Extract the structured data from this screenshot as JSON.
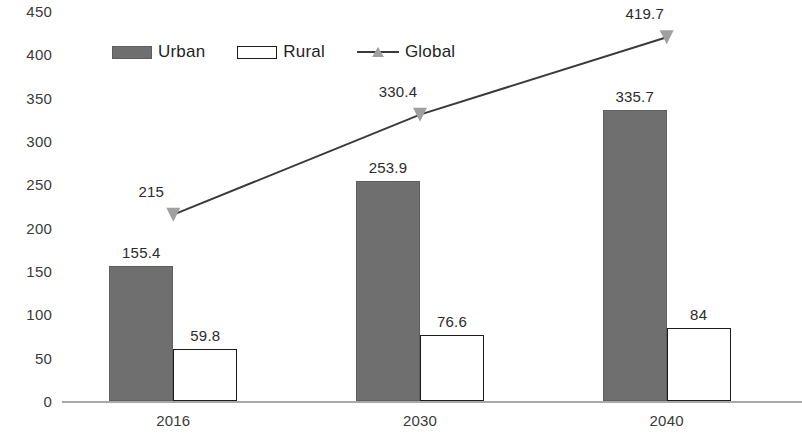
{
  "chart_data": {
    "type": "bar",
    "title": "",
    "subtitle": "",
    "xlabel": "",
    "ylabel": "",
    "categories": [
      "2016",
      "2030",
      "2040"
    ],
    "ylim": [
      0,
      450
    ],
    "y_ticks": [
      0,
      50,
      100,
      150,
      200,
      250,
      300,
      350,
      400,
      450
    ],
    "y_tick_labels": [
      "0",
      "50",
      "100",
      "150",
      "200",
      "250",
      "300",
      "350",
      "400",
      "450"
    ],
    "grid": false,
    "legend_position": "top-left",
    "series": [
      {
        "name": "Urban",
        "type": "bar",
        "color": "#6f6f6f",
        "values": [
          155.4,
          253.9,
          335.7
        ],
        "labels": [
          "155.4",
          "253.9",
          "335.7"
        ]
      },
      {
        "name": "Rural",
        "type": "bar",
        "color": "#ffffff",
        "border_color": "#1c1c1c",
        "values": [
          59.8,
          76.6,
          84
        ],
        "labels": [
          "59.8",
          "76.6",
          "84"
        ]
      },
      {
        "name": "Global",
        "type": "line",
        "color": "#3a3a3a",
        "marker": "triangle",
        "marker_color": "#a0a0a0",
        "values": [
          215,
          330.4,
          419.7
        ],
        "labels": [
          "215",
          "330.4",
          "419.7"
        ]
      }
    ]
  },
  "legend": {
    "items": [
      {
        "label": "Urban",
        "marker": "filled-square-swatch"
      },
      {
        "label": "Rural",
        "marker": "hollow-square-swatch"
      },
      {
        "label": "Global",
        "marker": "line-triangle-swatch"
      }
    ]
  }
}
